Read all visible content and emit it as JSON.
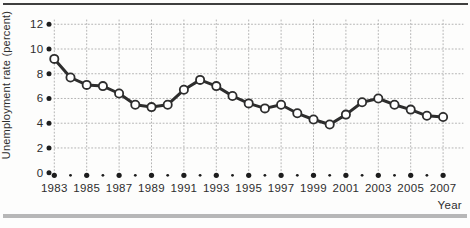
{
  "page": {
    "background": "#fdfdfc",
    "top_rule_color": "#3f3f3f",
    "bottom_band_color": "#b7b7b7"
  },
  "chart_data": {
    "type": "line",
    "xlabel": "Year",
    "ylabel": "Unemployment rate (percent)",
    "x": [
      1983,
      1984,
      1985,
      1986,
      1987,
      1988,
      1989,
      1990,
      1991,
      1992,
      1993,
      1994,
      1995,
      1996,
      1997,
      1998,
      1999,
      2000,
      2001,
      2002,
      2003,
      2004,
      2005,
      2006,
      2007
    ],
    "values": [
      9.2,
      7.7,
      7.1,
      7.0,
      6.4,
      5.5,
      5.3,
      5.5,
      6.7,
      7.5,
      7.0,
      6.2,
      5.6,
      5.2,
      5.5,
      4.8,
      4.3,
      3.9,
      4.7,
      5.7,
      6.0,
      5.5,
      5.1,
      4.6,
      4.5
    ],
    "series_name": "Unemployment rate",
    "ylim": [
      0,
      12
    ],
    "yticks": [
      0,
      2,
      4,
      6,
      8,
      10,
      12
    ],
    "xtick_labels": [
      "1983",
      "1985",
      "1987",
      "1989",
      "1991",
      "1993",
      "1995",
      "1997",
      "1999",
      "2001",
      "2003",
      "2005",
      "2007"
    ],
    "grid": "dotted",
    "legend": "none",
    "marker": "open-circle",
    "colors": {
      "line": "#2d2d2d",
      "marker_fill": "#ffffff",
      "grid": "#b4b4b4",
      "tick_dot": "#1d1d1d",
      "text": "#2e2e2e"
    }
  }
}
